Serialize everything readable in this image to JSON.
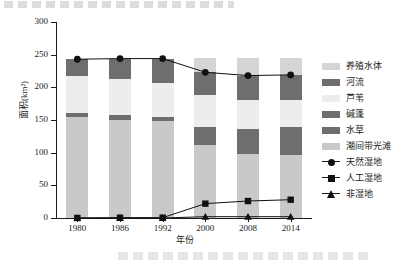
{
  "chart_data": {
    "type": "bar",
    "subtype": "stacked-bar-with-lines",
    "title": "",
    "xlabel": "年份",
    "ylabel": "面积(km²)",
    "ylim": [
      0,
      300
    ],
    "yticks": [
      0,
      50,
      100,
      150,
      200,
      250,
      300
    ],
    "grid": false,
    "legend_position": "right",
    "categories": [
      "1980",
      "1986",
      "1992",
      "2000",
      "2008",
      "2014"
    ],
    "stack_order_bottom_to_top": [
      "潮间带光滩",
      "水草",
      "碱蓬",
      "芦苇",
      "河流",
      "养殖水体"
    ],
    "series": [
      {
        "name": "潮间带光滩",
        "type": "bar",
        "color": "#c9c9c9",
        "values": [
          155,
          150,
          148,
          112,
          98,
          96
        ]
      },
      {
        "name": "水草",
        "type": "bar",
        "color": "#6e6e6e",
        "values": [
          0,
          0,
          0,
          27,
          38,
          43
        ]
      },
      {
        "name": "碱蓬",
        "type": "bar",
        "color": "#6e6e6e",
        "values": [
          5,
          8,
          7,
          0,
          0,
          0
        ]
      },
      {
        "name": "芦苇",
        "type": "bar",
        "color": "#ededed",
        "values": [
          58,
          55,
          51,
          49,
          45,
          42
        ]
      },
      {
        "name": "河流",
        "type": "bar",
        "color": "#6e6e6e",
        "values": [
          25,
          31,
          38,
          35,
          37,
          38
        ]
      },
      {
        "name": "养殖水体",
        "type": "bar",
        "color": "#d5d5d5",
        "values": [
          0,
          0,
          0,
          22,
          27,
          26
        ]
      },
      {
        "name": "天然湿地",
        "type": "line",
        "marker": "circle",
        "color": "#111111",
        "values": [
          243,
          244,
          244,
          223,
          218,
          219
        ]
      },
      {
        "name": "人工湿地",
        "type": "line",
        "marker": "square",
        "color": "#111111",
        "values": [
          0,
          0.5,
          0.5,
          22,
          26,
          28
        ]
      },
      {
        "name": "非湿地",
        "type": "line",
        "marker": "triangle",
        "color": "#111111",
        "values": [
          0,
          0,
          0,
          2,
          2,
          2
        ]
      }
    ],
    "legend": [
      {
        "label": "养殖水体",
        "kind": "swatch",
        "color": "#d5d5d5"
      },
      {
        "label": "河流",
        "kind": "swatch",
        "color": "#6e6e6e"
      },
      {
        "label": "芦苇",
        "kind": "swatch",
        "color": "#ededed"
      },
      {
        "label": "碱蓬",
        "kind": "swatch",
        "color": "#6e6e6e"
      },
      {
        "label": "水草",
        "kind": "swatch",
        "color": "#6e6e6e"
      },
      {
        "label": "潮间带光滩",
        "kind": "swatch",
        "color": "#c9c9c9"
      },
      {
        "label": "天然湿地",
        "kind": "line",
        "marker": "circle",
        "color": "#111111"
      },
      {
        "label": "人工湿地",
        "kind": "line",
        "marker": "square",
        "color": "#111111"
      },
      {
        "label": "非湿地",
        "kind": "line",
        "marker": "triangle",
        "color": "#111111"
      }
    ]
  },
  "axis": {
    "y_tick_labels": [
      "0",
      "50",
      "100",
      "150",
      "200",
      "250",
      "300"
    ],
    "x_tick_labels": [
      "1980",
      "1986",
      "1992",
      "2000",
      "2008",
      "2014"
    ],
    "y_title": "面积(km²)",
    "x_title": "年份"
  }
}
